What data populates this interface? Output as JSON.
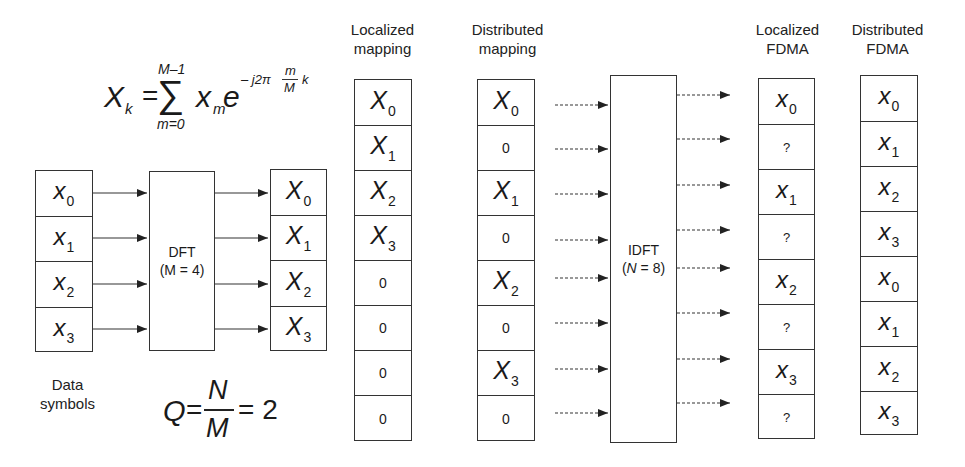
{
  "formula_dft": {
    "lhs": "X",
    "lhs_sub": "k",
    "equals": "=",
    "sum_upper": "M–1",
    "sum_lower": "m=0",
    "sum_symbol": "∑",
    "term": "x",
    "term_sub": "m",
    "exp_base": "e",
    "exp_prefix": "– j2π",
    "exp_frac_num": "m",
    "exp_frac_den": "M",
    "exp_suffix": "k"
  },
  "formula_q": {
    "lhs": "Q",
    "equals": "=",
    "num": "N",
    "den": "M",
    "result": "= 2"
  },
  "data_symbols": {
    "caption_line1": "Data",
    "caption_line2": "symbols",
    "cells": [
      {
        "sym": "x",
        "sub": "0"
      },
      {
        "sym": "x",
        "sub": "1"
      },
      {
        "sym": "x",
        "sub": "2"
      },
      {
        "sym": "x",
        "sub": "3"
      }
    ]
  },
  "dft_block": {
    "title": "DFT",
    "param": "(M = 4)"
  },
  "dft_output": {
    "cells": [
      {
        "sym": "X",
        "sub": "0"
      },
      {
        "sym": "X",
        "sub": "1"
      },
      {
        "sym": "X",
        "sub": "2"
      },
      {
        "sym": "X",
        "sub": "3"
      }
    ]
  },
  "localized_mapping": {
    "title_line1": "Localized",
    "title_line2": "mapping",
    "cells": [
      {
        "sym": "X",
        "sub": "0"
      },
      {
        "sym": "X",
        "sub": "1"
      },
      {
        "sym": "X",
        "sub": "2"
      },
      {
        "sym": "X",
        "sub": "3"
      },
      {
        "plain": "0"
      },
      {
        "plain": "0"
      },
      {
        "plain": "0"
      },
      {
        "plain": "0"
      }
    ]
  },
  "distributed_mapping": {
    "title_line1": "Distributed",
    "title_line2": "mapping",
    "cells": [
      {
        "sym": "X",
        "sub": "0"
      },
      {
        "plain": "0"
      },
      {
        "sym": "X",
        "sub": "1"
      },
      {
        "plain": "0"
      },
      {
        "sym": "X",
        "sub": "2"
      },
      {
        "plain": "0"
      },
      {
        "sym": "X",
        "sub": "3"
      },
      {
        "plain": "0"
      }
    ]
  },
  "idft_block": {
    "title": "IDFT",
    "param_open": "(",
    "param_var": "N",
    "param_rest": " = 8)"
  },
  "localized_fdma": {
    "title_line1": "Localized",
    "title_line2": "FDMA",
    "cells": [
      {
        "sym": "x",
        "sub": "0"
      },
      {
        "q": "?"
      },
      {
        "sym": "x",
        "sub": "1"
      },
      {
        "q": "?"
      },
      {
        "sym": "x",
        "sub": "2"
      },
      {
        "q": "?"
      },
      {
        "sym": "x",
        "sub": "3"
      },
      {
        "q": "?"
      }
    ]
  },
  "distributed_fdma": {
    "title_line1": "Distributed",
    "title_line2": "FDMA",
    "cells": [
      {
        "sym": "x",
        "sub": "0"
      },
      {
        "sym": "x",
        "sub": "1"
      },
      {
        "sym": "x",
        "sub": "2"
      },
      {
        "sym": "x",
        "sub": "3"
      },
      {
        "sym": "x",
        "sub": "0"
      },
      {
        "sym": "x",
        "sub": "1"
      },
      {
        "sym": "x",
        "sub": "2"
      },
      {
        "sym": "x",
        "sub": "3"
      }
    ]
  },
  "colors": {
    "line": "#333333",
    "text": "#1a1a1a",
    "background": "#ffffff"
  }
}
